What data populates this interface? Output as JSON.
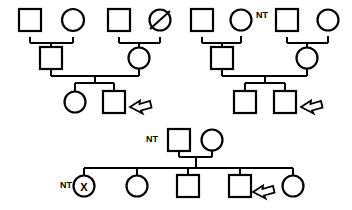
{
  "figure": {
    "kind": "pedigree-chart",
    "width": 352,
    "height": 210,
    "background_color": "#ffffff",
    "line_color": "#000000",
    "fill_affected": "#000000",
    "fill_unaffected": "#ffffff"
  },
  "legend_glyphs": {
    "square": "male",
    "circle": "female",
    "filled": "affected",
    "half_diagonal": "carrier",
    "slash": "deceased",
    "x_mark": "x-mark",
    "arrow": "proband-arrow",
    "nt": "NT"
  },
  "pedigrees": [
    {
      "id": "pedigree-left",
      "name": "left-pedigree",
      "generations": [
        {
          "id": "gen-1",
          "label": "I",
          "individuals": [
            {
              "id": "L-I-1",
              "name": "male-unaffected",
              "sex": "male",
              "shape": "square",
              "fill": "none",
              "annotation": "",
              "x": 30,
              "y": 20,
              "size": 22
            },
            {
              "id": "L-I-2",
              "name": "female-carrier",
              "sex": "female",
              "shape": "circle",
              "fill": "half-upper-left",
              "annotation": "",
              "x": 73,
              "y": 20,
              "size": 22
            }
          ]
        },
        {
          "id": "gen-2",
          "label": "II",
          "individuals": [
            {
              "id": "L-II-1",
              "name": "male-carrier",
              "sex": "male",
              "shape": "square",
              "fill": "half-lower-left",
              "annotation": "",
              "x": 51,
              "y": 53,
              "size": 22
            }
          ]
        },
        {
          "id": "gen-3",
          "label": "III",
          "individuals": [
            {
              "id": "L-III-1",
              "name": "female-unaffected",
              "sex": "female",
              "shape": "circle",
              "fill": "none",
              "annotation": "",
              "x": 75,
              "y": 92,
              "size": 21
            },
            {
              "id": "L-III-2",
              "name": "male-carrier-proband",
              "sex": "male",
              "shape": "square",
              "fill": "half-lower-left",
              "annotation": "proband",
              "x": 114,
              "y": 92,
              "size": 22
            }
          ]
        }
      ]
    },
    {
      "id": "pedigree-left-spouse-family",
      "name": "left-spouse-family",
      "generations": [
        {
          "id": "gen-1",
          "label": "I",
          "individuals": [
            {
              "id": "LS-I-1",
              "name": "male-unaffected",
              "sex": "male",
              "shape": "square",
              "fill": "none",
              "annotation": "",
              "x": 119,
              "y": 20,
              "size": 22
            },
            {
              "id": "LS-I-2",
              "name": "female-deceased",
              "sex": "female",
              "shape": "circle",
              "fill": "none",
              "annotation": "deceased",
              "x": 160,
              "y": 20,
              "size": 21
            }
          ]
        },
        {
          "id": "gen-2",
          "label": "II",
          "individuals": [
            {
              "id": "LS-II-1",
              "name": "female-carrier",
              "sex": "female",
              "shape": "circle",
              "fill": "half-upper-left",
              "annotation": "",
              "x": 139,
              "y": 53,
              "size": 21
            }
          ]
        }
      ]
    },
    {
      "id": "pedigree-right",
      "name": "right-pedigree",
      "generations": [
        {
          "id": "gen-1",
          "label": "I",
          "individuals": [
            {
              "id": "R-I-1",
              "name": "male-unaffected",
              "sex": "male",
              "shape": "square",
              "fill": "none",
              "annotation": "",
              "x": 202,
              "y": 20,
              "size": 22
            },
            {
              "id": "R-I-2",
              "name": "female-not-tested",
              "sex": "female",
              "shape": "circle",
              "fill": "none",
              "annotation": "NT",
              "x": 241,
              "y": 20,
              "size": 21
            }
          ]
        },
        {
          "id": "gen-2",
          "label": "II",
          "individuals": [
            {
              "id": "R-II-1",
              "name": "male-carrier",
              "sex": "male",
              "shape": "square",
              "fill": "half-lower-left",
              "annotation": "",
              "x": 222,
              "y": 53,
              "size": 22
            }
          ]
        },
        {
          "id": "gen-3",
          "label": "III",
          "individuals": [
            {
              "id": "R-III-1",
              "name": "male-carrier-x-marked",
              "sex": "male",
              "shape": "square",
              "fill": "half-lower-left",
              "annotation": "X",
              "x": 245,
              "y": 92,
              "size": 22
            },
            {
              "id": "R-III-2",
              "name": "male-affected-proband",
              "sex": "male",
              "shape": "square",
              "fill": "full",
              "annotation": "proband",
              "x": 285,
              "y": 92,
              "size": 22
            }
          ]
        }
      ]
    },
    {
      "id": "pedigree-right-spouse-family",
      "name": "right-spouse-family",
      "generations": [
        {
          "id": "gen-1",
          "label": "I",
          "individuals": [
            {
              "id": "RS-I-1",
              "name": "male-carrier",
              "sex": "male",
              "shape": "square",
              "fill": "half-lower-left",
              "annotation": "",
              "x": 287,
              "y": 20,
              "size": 22
            },
            {
              "id": "RS-I-2",
              "name": "female-unaffected",
              "sex": "female",
              "shape": "circle",
              "fill": "none",
              "annotation": "",
              "x": 328,
              "y": 20,
              "size": 21
            }
          ]
        },
        {
          "id": "gen-2",
          "label": "II",
          "individuals": [
            {
              "id": "RS-II-1",
              "name": "female-carrier",
              "sex": "female",
              "shape": "circle",
              "fill": "half-upper-left",
              "annotation": "",
              "x": 307,
              "y": 53,
              "size": 21
            }
          ]
        }
      ]
    },
    {
      "id": "pedigree-bottom",
      "name": "bottom-pedigree",
      "generations": [
        {
          "id": "gen-1",
          "label": "I",
          "individuals": [
            {
              "id": "B-I-1",
              "name": "male-not-tested",
              "sex": "male",
              "shape": "square",
              "fill": "none",
              "annotation": "NT",
              "x": 168,
              "y": 140,
              "size": 22
            },
            {
              "id": "B-I-2",
              "name": "female-carrier",
              "sex": "female",
              "shape": "circle",
              "fill": "half-upper-left",
              "annotation": "",
              "x": 207,
              "y": 140,
              "size": 21
            }
          ]
        },
        {
          "id": "gen-2",
          "label": "II",
          "individuals": [
            {
              "id": "B-II-1",
              "name": "female-not-tested-x-marked",
              "sex": "female",
              "shape": "circle",
              "fill": "none",
              "annotation": "NT-X",
              "x": 84,
              "y": 185,
              "size": 21
            },
            {
              "id": "B-II-2",
              "name": "female-affected-x-marked",
              "sex": "female",
              "shape": "circle",
              "fill": "full",
              "annotation": "X",
              "x": 137,
              "y": 185,
              "size": 21
            },
            {
              "id": "B-II-3",
              "name": "male-affected",
              "sex": "male",
              "shape": "square",
              "fill": "full",
              "annotation": "",
              "x": 188,
              "y": 185,
              "size": 22
            },
            {
              "id": "B-II-4",
              "name": "male-affected-proband",
              "sex": "male",
              "shape": "square",
              "fill": "full",
              "annotation": "proband",
              "x": 240,
              "y": 185,
              "size": 22
            },
            {
              "id": "B-II-5",
              "name": "female-affected-x-marked",
              "sex": "female",
              "shape": "circle",
              "fill": "full",
              "annotation": "X",
              "x": 293,
              "y": 185,
              "size": 21
            }
          ]
        }
      ]
    }
  ],
  "annotations": {
    "nt_left_top": "NT",
    "nt_right_top": "NT",
    "nt_bottom_father": "NT",
    "nt_bottom_daughter": "NT",
    "x_right_iii": "X",
    "x_bottom_1": "X",
    "x_bottom_2": "X",
    "x_bottom_5": "X"
  }
}
